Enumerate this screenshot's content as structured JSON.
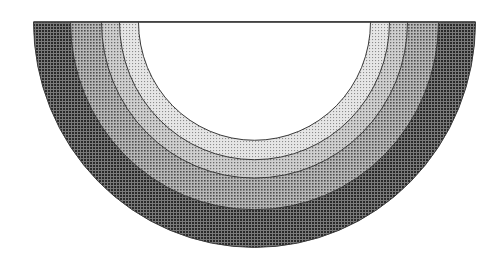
{
  "diagram": {
    "center": {
      "x": 254.5,
      "y": 22
    },
    "vertical_stretch": 1.02,
    "inner_hole": {
      "name": "core",
      "rx": 116,
      "fill": "#ffffff"
    },
    "rings": [
      {
        "name": "ring-4-outer",
        "rx": 221,
        "base": "#7a7a7a",
        "dot": "#2a2a2a",
        "label": "Outermost layer"
      },
      {
        "name": "ring-3",
        "rx": 184,
        "base": "#b8b8b8",
        "dot": "#4e4e4e",
        "label": "Third layer"
      },
      {
        "name": "ring-2",
        "rx": 153,
        "base": "#cfcfcf",
        "dot": "#6a6a6a",
        "label": "Second layer"
      },
      {
        "name": "ring-1-inner",
        "rx": 135,
        "base": "#e6e6e6",
        "dot": "#8c8c8c",
        "label": "Innermost layer"
      }
    ],
    "line_color": "#3a3a3a",
    "baseline_color": "#444444"
  }
}
